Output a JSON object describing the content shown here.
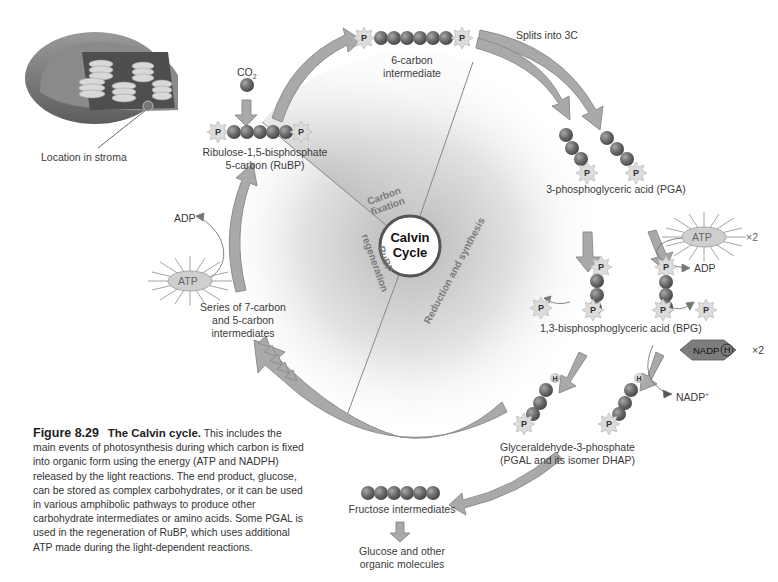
{
  "figure": {
    "number": "Figure 8.29",
    "title": "The Calvin cycle.",
    "caption": "This includes the main events of photosynthesis during which carbon is fixed into organic form using the energy (ATP and NADPH) released by the light reactions. The end product, glucose, can be stored as complex carbohydrates, or it can be used in various amphibolic pathways to produce other carbohydrate intermediates or amino acids. Some PGAL is used in the regeneration of RuBP, which uses additional ATP made during the light-dependent reactions."
  },
  "chloroplast": {
    "label": "Location in stroma"
  },
  "center": {
    "title_line1": "Calvin",
    "title_line2": "Cycle"
  },
  "sectors": {
    "carbon_fixation_1": "Carbon",
    "carbon_fixation_2": "fixation",
    "rubp_regen_1": "RuBP",
    "rubp_regen_2": "regeneration",
    "reduction": "Reduction and synthesis"
  },
  "molecules": {
    "co2": "CO",
    "co2_sub": "2",
    "rubp_line1": "Ribulose-1,5-bisphosphate",
    "rubp_line2": "5-carbon (RuBP)",
    "six_carbon_line1": "6-carbon",
    "six_carbon_line2": "intermediate",
    "splits": "Splits into 3C",
    "pga": "3-phosphoglyceric acid (PGA)",
    "bpg": "1,3-bisphosphoglyceric acid (BPG)",
    "pgal_line1": "Glyceraldehyde-3-phosphate",
    "pgal_line2": "(PGAL and its isomer DHAP)",
    "fructose": "Fructose intermediates",
    "glucose_line1": "Glucose and other",
    "glucose_line2": "organic molecules",
    "series_line1": "Series of 7-carbon",
    "series_line2": "and 5-carbon",
    "series_line3": "intermediates"
  },
  "cofactors": {
    "atp": "ATP",
    "adp": "ADP",
    "x2": "×2",
    "nadph": "NADP",
    "nadph_h": "H",
    "nadp_plus": "NADP",
    "nadp_plus_sup": "+",
    "phosphate": "P",
    "hydrogen": "H"
  },
  "colors": {
    "arrow_fill": "#a9a9a9",
    "arrow_stroke": "#8a8a8a",
    "carbon_ball": "#6f6f6f",
    "phosphate_star": "#d9d9d9",
    "background_wedge": "#d6d6d6",
    "nadph_hex": "#7d7d7d"
  }
}
